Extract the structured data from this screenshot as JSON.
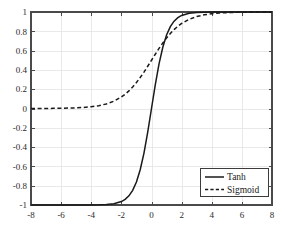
{
  "chart_data": {
    "type": "line",
    "title": "",
    "xlabel": "",
    "ylabel": "",
    "xlim": [
      -8,
      8
    ],
    "ylim": [
      -1,
      1
    ],
    "grid": true,
    "legend_position": "lower-right",
    "xticks": [
      -8,
      -6,
      -4,
      -2,
      0,
      2,
      4,
      6,
      8
    ],
    "xtick_labels": [
      "-8",
      "-6",
      "-4",
      "-2",
      "0",
      "2",
      "4",
      "6",
      "8"
    ],
    "yticks": [
      1,
      0.8,
      0.6,
      0.4,
      0.2,
      0,
      -0.2,
      -0.4,
      -0.6,
      -0.8,
      -1
    ],
    "ytick_labels": [
      "1",
      "0.8",
      "0.6",
      "0.4",
      "0.2",
      "0",
      "-0.2",
      "-0.4",
      "-0.6",
      "-0.8",
      "-1"
    ],
    "x": [
      -8,
      -7.5,
      -7,
      -6.5,
      -6,
      -5.5,
      -5,
      -4.5,
      -4,
      -3.5,
      -3,
      -2.5,
      -2,
      -1.75,
      -1.5,
      -1.25,
      -1,
      -0.75,
      -0.5,
      -0.25,
      0,
      0.25,
      0.5,
      0.75,
      1,
      1.25,
      1.5,
      1.75,
      2,
      2.5,
      3,
      3.5,
      4,
      4.5,
      5,
      5.5,
      6,
      6.5,
      7,
      7.5,
      8
    ],
    "series": [
      {
        "name": "Tanh",
        "style": "solid",
        "color": "#1a1a1a",
        "values": [
          -1,
          -1,
          -1,
          -1,
          -0.99999,
          -0.99997,
          -0.9999,
          -0.99975,
          -0.99933,
          -0.99818,
          -0.99505,
          -0.98661,
          -0.96403,
          -0.94138,
          -0.90515,
          -0.84828,
          -0.76159,
          -0.63515,
          -0.46212,
          -0.24492,
          0,
          0.24492,
          0.46212,
          0.63515,
          0.76159,
          0.84828,
          0.90515,
          0.94138,
          0.96403,
          0.98661,
          0.99505,
          0.99818,
          0.99933,
          0.99975,
          0.9999,
          0.99997,
          0.99999,
          1,
          1,
          1,
          1
        ]
      },
      {
        "name": "Sigmoid",
        "style": "dashed",
        "color": "#1a1a1a",
        "values": [
          0.00034,
          0.00055,
          0.00091,
          0.0015,
          0.00247,
          0.00407,
          0.00669,
          0.01099,
          0.01799,
          0.02931,
          0.04743,
          0.07586,
          0.1192,
          0.14804,
          0.18243,
          0.2227,
          0.26894,
          0.32082,
          0.37754,
          0.43782,
          0.5,
          0.56218,
          0.62246,
          0.67918,
          0.73106,
          0.7773,
          0.81757,
          0.85196,
          0.8808,
          0.92414,
          0.95257,
          0.97069,
          0.98201,
          0.98901,
          0.99331,
          0.99593,
          0.99753,
          0.9985,
          0.99909,
          0.99945,
          0.99966
        ]
      }
    ]
  },
  "legend": {
    "entries": [
      {
        "label": "Tanh",
        "style": "solid"
      },
      {
        "label": "Sigmoid",
        "style": "dashed"
      }
    ]
  },
  "colors": {
    "background": "#ffffff",
    "axis": "#4a4a4a",
    "grid": "#e4e4e4",
    "curve": "#1a1a1a",
    "tick_text": "#2b2b2b"
  }
}
